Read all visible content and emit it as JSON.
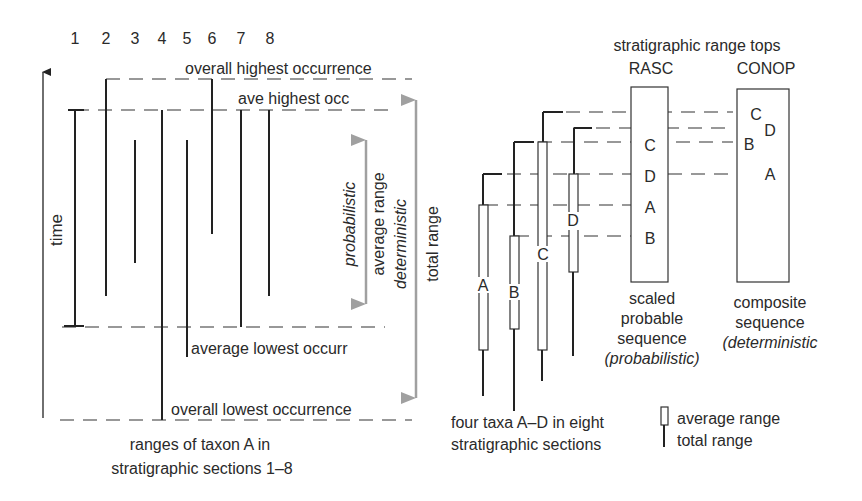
{
  "left_panel": {
    "section_numbers": [
      "1",
      "2",
      "3",
      "4",
      "5",
      "6",
      "7",
      "8"
    ],
    "axis_label": "time",
    "labels": {
      "overall_highest": "overall highest occurrence",
      "ave_highest": "ave highest occ",
      "average_lowest": "average lowest occurr",
      "overall_lowest": "overall lowest occurrence",
      "probabilistic": "probabilistic",
      "average_range": "average range",
      "deterministic": "deterministic",
      "total_range": "total range"
    },
    "caption_line1": "ranges of taxon A in",
    "caption_line2": "stratigraphic sections 1–8"
  },
  "right_panel": {
    "title": "stratigraphic range tops",
    "rasc_label": "RASC",
    "conop_label": "CONOP",
    "taxa": [
      "A",
      "B",
      "C",
      "D"
    ],
    "rasc_sequence": [
      "C",
      "D",
      "A",
      "B"
    ],
    "conop_sequence": [
      "C",
      "D",
      "B",
      "A"
    ],
    "rasc_caption": [
      "scaled",
      "probable",
      "sequence",
      "(probabilistic)"
    ],
    "conop_caption": [
      "composite",
      "sequence",
      "(deterministic"
    ],
    "taxa_caption_line1": "four taxa A–D in eight",
    "taxa_caption_line2": "stratigraphic sections",
    "legend": {
      "average_range": "average range",
      "total_range": "total range"
    }
  },
  "colors": {
    "ink": "#222222",
    "arrow_gray": "#a0a0a0"
  }
}
